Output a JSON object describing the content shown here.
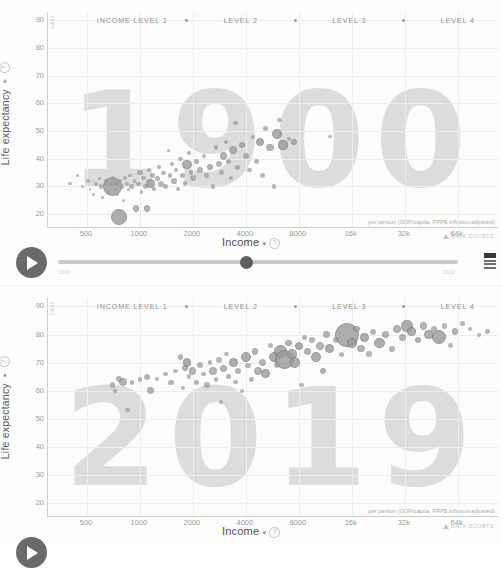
{
  "app": {
    "name": "Gapminder Tools — Bubble Chart",
    "panels": [
      {
        "id": "1900",
        "year_watermark": "1900"
      },
      {
        "id": "2019",
        "year_watermark": "2019"
      }
    ]
  },
  "legend": {
    "items": [
      "INCOME LEVEL 1",
      "LEVEL 2",
      "LEVEL 3",
      "LEVEL 4"
    ],
    "separator_icon": "diamond-dot-icon"
  },
  "axes": {
    "y": {
      "label": "Life expectancy",
      "caret": "▾",
      "help_icon": "?",
      "unit": "years",
      "ticks": [
        "90",
        "80",
        "70",
        "60",
        "50",
        "40",
        "30",
        "20"
      ],
      "min": 15,
      "max": 93
    },
    "x": {
      "label": "Income",
      "caret": "▾",
      "help_icon": "?",
      "ticks": [
        "500",
        "1000",
        "2000",
        "4000",
        "8000",
        "16k",
        "32k",
        "64k"
      ],
      "tick_values": [
        500,
        1000,
        2000,
        4000,
        8000,
        16000,
        32000,
        64000
      ],
      "note": "per person (GDP/capita, PPP$ inflation-adjusted)",
      "min": 300,
      "max": 110000,
      "scale": "log"
    }
  },
  "controls": {
    "play_label": "play-button",
    "slider_position_pct": 47,
    "slider_start_label": "1800",
    "slider_end_label": "2019",
    "flag_icon": "country-flag-icon",
    "data_doubts_label": "DATA DOUBTS",
    "warning_icon": "warning-triangle-icon"
  },
  "colors": {
    "background": "#fdfdfd",
    "plot_background": "#fcfcfc",
    "gridline": "#ededed",
    "axis_line": "#cfcfcf",
    "tick_text": "#9b9b9b",
    "axis_label": "#4d4d4d",
    "legend_text": "#8e8e8e",
    "watermark": "#dcdcdc",
    "bubble_fill": "#9a9a9a",
    "bubble_stroke": "#7d7d7d",
    "play_button": "#6a6a6a",
    "slider_track": "#c9c9c9",
    "slider_handle": "#5e5e5e"
  },
  "chart_data": {
    "type": "scatter",
    "xlabel": "Income",
    "ylabel": "Life expectancy",
    "xlim": [
      300,
      110000
    ],
    "ylim": [
      15,
      93
    ],
    "xscale": "log",
    "grid": true,
    "legend_position": "top",
    "legend": [
      "INCOME LEVEL 1",
      "LEVEL 2",
      "LEVEL 3",
      "LEVEL 4"
    ],
    "panels": [
      {
        "year": 1900,
        "points": [
          {
            "x": 400,
            "y": 31,
            "r": 1.8
          },
          {
            "x": 440,
            "y": 34,
            "r": 1.6
          },
          {
            "x": 470,
            "y": 30,
            "r": 1.5
          },
          {
            "x": 505,
            "y": 32,
            "r": 1.9
          },
          {
            "x": 520,
            "y": 29,
            "r": 1.4
          },
          {
            "x": 545,
            "y": 27,
            "r": 1.6
          },
          {
            "x": 560,
            "y": 31,
            "r": 2.1
          },
          {
            "x": 585,
            "y": 33,
            "r": 1.5
          },
          {
            "x": 600,
            "y": 30,
            "r": 2.4
          },
          {
            "x": 615,
            "y": 26,
            "r": 1.5
          },
          {
            "x": 640,
            "y": 32,
            "r": 1.8
          },
          {
            "x": 665,
            "y": 28,
            "r": 1.6
          },
          {
            "x": 680,
            "y": 31,
            "r": 2.0
          },
          {
            "x": 700,
            "y": 30,
            "r": 9.5
          },
          {
            "x": 705,
            "y": 33,
            "r": 2.2
          },
          {
            "x": 720,
            "y": 29,
            "r": 1.7
          },
          {
            "x": 735,
            "y": 31,
            "r": 2.6
          },
          {
            "x": 745,
            "y": 27,
            "r": 1.6
          },
          {
            "x": 760,
            "y": 19,
            "r": 8.0
          },
          {
            "x": 770,
            "y": 32,
            "r": 1.9
          },
          {
            "x": 790,
            "y": 30,
            "r": 2.3
          },
          {
            "x": 805,
            "y": 25,
            "r": 1.5
          },
          {
            "x": 820,
            "y": 33,
            "r": 1.8
          },
          {
            "x": 840,
            "y": 31,
            "r": 2.0
          },
          {
            "x": 860,
            "y": 29,
            "r": 1.6
          },
          {
            "x": 880,
            "y": 34,
            "r": 1.7
          },
          {
            "x": 900,
            "y": 30,
            "r": 2.5
          },
          {
            "x": 930,
            "y": 32,
            "r": 1.9
          },
          {
            "x": 950,
            "y": 22,
            "r": 3.4
          },
          {
            "x": 980,
            "y": 31,
            "r": 2.1
          },
          {
            "x": 1000,
            "y": 35,
            "r": 2.8
          },
          {
            "x": 1020,
            "y": 28,
            "r": 1.8
          },
          {
            "x": 1050,
            "y": 33,
            "r": 2.2
          },
          {
            "x": 1080,
            "y": 30,
            "r": 2.6
          },
          {
            "x": 1100,
            "y": 22,
            "r": 3.2
          },
          {
            "x": 1130,
            "y": 36,
            "r": 2.0
          },
          {
            "x": 1150,
            "y": 31,
            "r": 4.2
          },
          {
            "x": 1180,
            "y": 34,
            "r": 2.3
          },
          {
            "x": 1200,
            "y": 29,
            "r": 1.9
          },
          {
            "x": 1250,
            "y": 33,
            "r": 2.5
          },
          {
            "x": 1280,
            "y": 37,
            "r": 1.8
          },
          {
            "x": 1320,
            "y": 31,
            "r": 2.9
          },
          {
            "x": 1360,
            "y": 35,
            "r": 2.1
          },
          {
            "x": 1400,
            "y": 30,
            "r": 2.4
          },
          {
            "x": 1450,
            "y": 43,
            "r": 1.7
          },
          {
            "x": 1480,
            "y": 34,
            "r": 2.2
          },
          {
            "x": 1520,
            "y": 38,
            "r": 2.0
          },
          {
            "x": 1560,
            "y": 32,
            "r": 2.6
          },
          {
            "x": 1600,
            "y": 36,
            "r": 2.3
          },
          {
            "x": 1650,
            "y": 29,
            "r": 1.9
          },
          {
            "x": 1700,
            "y": 40,
            "r": 2.1
          },
          {
            "x": 1750,
            "y": 34,
            "r": 2.7
          },
          {
            "x": 1800,
            "y": 31,
            "r": 2.2
          },
          {
            "x": 1850,
            "y": 38,
            "r": 4.6
          },
          {
            "x": 1900,
            "y": 42,
            "r": 1.8
          },
          {
            "x": 1950,
            "y": 35,
            "r": 2.4
          },
          {
            "x": 2000,
            "y": 33,
            "r": 3.0
          },
          {
            "x": 2100,
            "y": 39,
            "r": 2.2
          },
          {
            "x": 2200,
            "y": 36,
            "r": 2.8
          },
          {
            "x": 2300,
            "y": 41,
            "r": 2.0
          },
          {
            "x": 2400,
            "y": 34,
            "r": 2.5
          },
          {
            "x": 2500,
            "y": 37,
            "r": 3.2
          },
          {
            "x": 2600,
            "y": 30,
            "r": 2.1
          },
          {
            "x": 2700,
            "y": 44,
            "r": 2.3
          },
          {
            "x": 2800,
            "y": 38,
            "r": 2.9
          },
          {
            "x": 2900,
            "y": 35,
            "r": 2.4
          },
          {
            "x": 3000,
            "y": 41,
            "r": 3.6
          },
          {
            "x": 3100,
            "y": 46,
            "r": 2.0
          },
          {
            "x": 3200,
            "y": 39,
            "r": 2.7
          },
          {
            "x": 3300,
            "y": 33,
            "r": 2.2
          },
          {
            "x": 3400,
            "y": 43,
            "r": 4.0
          },
          {
            "x": 3500,
            "y": 53,
            "r": 2.2
          },
          {
            "x": 3600,
            "y": 37,
            "r": 2.5
          },
          {
            "x": 3800,
            "y": 45,
            "r": 3.4
          },
          {
            "x": 4000,
            "y": 41,
            "r": 3.0
          },
          {
            "x": 4200,
            "y": 36,
            "r": 2.3
          },
          {
            "x": 4400,
            "y": 48,
            "r": 2.1
          },
          {
            "x": 4600,
            "y": 39,
            "r": 2.8
          },
          {
            "x": 4800,
            "y": 46,
            "r": 4.2
          },
          {
            "x": 5000,
            "y": 34,
            "r": 2.4
          },
          {
            "x": 5200,
            "y": 51,
            "r": 2.6
          },
          {
            "x": 5500,
            "y": 44,
            "r": 3.8
          },
          {
            "x": 5800,
            "y": 30,
            "r": 2.2
          },
          {
            "x": 6000,
            "y": 49,
            "r": 5.2
          },
          {
            "x": 6200,
            "y": 54,
            "r": 2.3
          },
          {
            "x": 6500,
            "y": 45,
            "r": 4.6
          },
          {
            "x": 7000,
            "y": 47,
            "r": 2.0
          },
          {
            "x": 7500,
            "y": 46,
            "r": 3.2
          },
          {
            "x": 12000,
            "y": 48,
            "r": 1.8
          }
        ]
      },
      {
        "year": 2019,
        "points": [
          {
            "x": 700,
            "y": 62,
            "r": 2.6
          },
          {
            "x": 720,
            "y": 60,
            "r": 2.0
          },
          {
            "x": 760,
            "y": 64,
            "r": 3.0
          },
          {
            "x": 800,
            "y": 63,
            "r": 4.0
          },
          {
            "x": 850,
            "y": 53,
            "r": 2.2
          },
          {
            "x": 900,
            "y": 63,
            "r": 2.4
          },
          {
            "x": 1000,
            "y": 64,
            "r": 2.2
          },
          {
            "x": 1100,
            "y": 65,
            "r": 3.0
          },
          {
            "x": 1150,
            "y": 60,
            "r": 3.4
          },
          {
            "x": 1250,
            "y": 64,
            "r": 2.0
          },
          {
            "x": 1400,
            "y": 66,
            "r": 2.2
          },
          {
            "x": 1500,
            "y": 63,
            "r": 2.6
          },
          {
            "x": 1600,
            "y": 67,
            "r": 2.4
          },
          {
            "x": 1700,
            "y": 72,
            "r": 2.8
          },
          {
            "x": 1750,
            "y": 61,
            "r": 1.9
          },
          {
            "x": 1800,
            "y": 68,
            "r": 3.2
          },
          {
            "x": 1850,
            "y": 70,
            "r": 4.2
          },
          {
            "x": 1900,
            "y": 65,
            "r": 2.3
          },
          {
            "x": 2000,
            "y": 67,
            "r": 3.6
          },
          {
            "x": 2100,
            "y": 63,
            "r": 2.5
          },
          {
            "x": 2200,
            "y": 69,
            "r": 3.0
          },
          {
            "x": 2300,
            "y": 66,
            "r": 2.2
          },
          {
            "x": 2400,
            "y": 62,
            "r": 2.7
          },
          {
            "x": 2500,
            "y": 70,
            "r": 2.4
          },
          {
            "x": 2600,
            "y": 67,
            "r": 3.8
          },
          {
            "x": 2700,
            "y": 64,
            "r": 2.1
          },
          {
            "x": 2800,
            "y": 71,
            "r": 2.9
          },
          {
            "x": 2900,
            "y": 56,
            "r": 2.0
          },
          {
            "x": 3000,
            "y": 68,
            "r": 3.4
          },
          {
            "x": 3100,
            "y": 73,
            "r": 2.3
          },
          {
            "x": 3200,
            "y": 65,
            "r": 2.6
          },
          {
            "x": 3400,
            "y": 70,
            "r": 4.4
          },
          {
            "x": 3500,
            "y": 63,
            "r": 2.2
          },
          {
            "x": 3600,
            "y": 67,
            "r": 3.0
          },
          {
            "x": 3800,
            "y": 60,
            "r": 2.0
          },
          {
            "x": 4000,
            "y": 72,
            "r": 5.0
          },
          {
            "x": 4100,
            "y": 69,
            "r": 2.8
          },
          {
            "x": 4300,
            "y": 64,
            "r": 2.4
          },
          {
            "x": 4500,
            "y": 74,
            "r": 3.2
          },
          {
            "x": 4700,
            "y": 67,
            "r": 4.0
          },
          {
            "x": 5000,
            "y": 70,
            "r": 3.6
          },
          {
            "x": 5200,
            "y": 66,
            "r": 4.6
          },
          {
            "x": 5500,
            "y": 76,
            "r": 2.6
          },
          {
            "x": 5800,
            "y": 72,
            "r": 5.4
          },
          {
            "x": 6000,
            "y": 69,
            "r": 3.0
          },
          {
            "x": 6300,
            "y": 74,
            "r": 6.2
          },
          {
            "x": 6600,
            "y": 71,
            "r": 9.5
          },
          {
            "x": 7000,
            "y": 77,
            "r": 3.4
          },
          {
            "x": 7300,
            "y": 73,
            "r": 4.8
          },
          {
            "x": 7600,
            "y": 70,
            "r": 5.6
          },
          {
            "x": 8000,
            "y": 76,
            "r": 4.2
          },
          {
            "x": 8300,
            "y": 62,
            "r": 2.2
          },
          {
            "x": 8600,
            "y": 79,
            "r": 2.8
          },
          {
            "x": 9000,
            "y": 74,
            "r": 3.6
          },
          {
            "x": 9500,
            "y": 78,
            "r": 3.0
          },
          {
            "x": 10000,
            "y": 72,
            "r": 5.2
          },
          {
            "x": 10500,
            "y": 76,
            "r": 4.0
          },
          {
            "x": 11000,
            "y": 67,
            "r": 3.2
          },
          {
            "x": 11500,
            "y": 80,
            "r": 3.4
          },
          {
            "x": 12000,
            "y": 75,
            "r": 4.6
          },
          {
            "x": 13000,
            "y": 78,
            "r": 3.0
          },
          {
            "x": 14000,
            "y": 73,
            "r": 2.6
          },
          {
            "x": 15000,
            "y": 80,
            "r": 12.0
          },
          {
            "x": 16000,
            "y": 77,
            "r": 5.0
          },
          {
            "x": 17000,
            "y": 82,
            "r": 3.2
          },
          {
            "x": 18000,
            "y": 75,
            "r": 3.8
          },
          {
            "x": 19000,
            "y": 79,
            "r": 4.4
          },
          {
            "x": 20000,
            "y": 73,
            "r": 2.8
          },
          {
            "x": 21000,
            "y": 81,
            "r": 3.0
          },
          {
            "x": 23000,
            "y": 77,
            "r": 5.2
          },
          {
            "x": 25000,
            "y": 80,
            "r": 3.4
          },
          {
            "x": 27000,
            "y": 75,
            "r": 3.0
          },
          {
            "x": 29000,
            "y": 82,
            "r": 4.0
          },
          {
            "x": 31000,
            "y": 79,
            "r": 3.6
          },
          {
            "x": 33000,
            "y": 83,
            "r": 5.6
          },
          {
            "x": 35000,
            "y": 81,
            "r": 4.2
          },
          {
            "x": 38000,
            "y": 78,
            "r": 3.2
          },
          {
            "x": 41000,
            "y": 83,
            "r": 3.8
          },
          {
            "x": 44000,
            "y": 80,
            "r": 4.6
          },
          {
            "x": 47000,
            "y": 82,
            "r": 3.0
          },
          {
            "x": 50000,
            "y": 79,
            "r": 7.0
          },
          {
            "x": 54000,
            "y": 83,
            "r": 2.8
          },
          {
            "x": 58000,
            "y": 76,
            "r": 2.4
          },
          {
            "x": 62000,
            "y": 81,
            "r": 3.2
          },
          {
            "x": 68000,
            "y": 84,
            "r": 2.6
          },
          {
            "x": 75000,
            "y": 82,
            "r": 2.2
          },
          {
            "x": 85000,
            "y": 80,
            "r": 2.0
          },
          {
            "x": 95000,
            "y": 81,
            "r": 2.4
          }
        ]
      }
    ]
  }
}
